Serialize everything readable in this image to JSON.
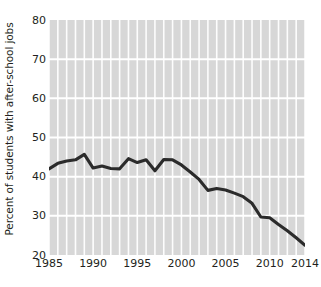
{
  "chart_data": {
    "type": "line",
    "title": "",
    "xlabel": "",
    "ylabel": "Percent of students with after-school jobs",
    "xlim": [
      1985,
      2014
    ],
    "ylim": [
      20,
      80
    ],
    "ytick_values": [
      80,
      70,
      60,
      50,
      40,
      30,
      20
    ],
    "ytick_labels": [
      "80",
      "70",
      "60",
      "50",
      "40",
      "30",
      "20"
    ],
    "xtick_values": [
      1985,
      1990,
      1995,
      2000,
      2005,
      2010,
      2014
    ],
    "xtick_labels": [
      "1985",
      "1990",
      "1995",
      "2000",
      "2005",
      "2010",
      "2014"
    ],
    "grid": "white gridlines on gray panel; vertical gridline每 year, horizontal gridline every 10 units",
    "legend": "none",
    "x": [
      1985,
      1986,
      1987,
      1988,
      1989,
      1990,
      1991,
      1992,
      1993,
      1994,
      1995,
      1996,
      1997,
      1998,
      1999,
      2000,
      2001,
      2002,
      2003,
      2004,
      2005,
      2006,
      2007,
      2008,
      2009,
      2010,
      2011,
      2012,
      2013,
      2014
    ],
    "values": [
      42.0,
      43.4,
      44.0,
      44.3,
      45.7,
      42.2,
      42.7,
      42.1,
      42.0,
      44.6,
      43.6,
      44.3,
      41.5,
      44.4,
      44.3,
      43.0,
      41.2,
      39.3,
      36.5,
      37.0,
      36.6,
      35.8,
      34.9,
      33.2,
      29.7,
      29.5,
      27.8,
      26.2,
      24.4,
      22.5
    ],
    "series_color": "#2b2b2b",
    "panel_color": "#d7d7d7",
    "gridline_color": "#ffffff"
  },
  "axes": {
    "y_title": "Percent of students with after-school jobs"
  }
}
